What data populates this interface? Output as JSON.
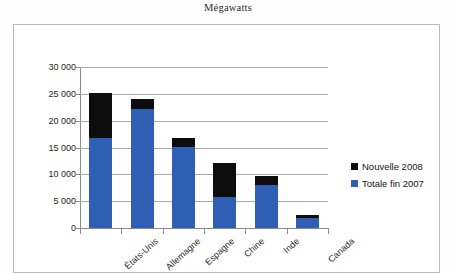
{
  "chart_data": {
    "type": "bar",
    "subtype": "stacked-vertical",
    "title": "Mégawatts",
    "xlabel": "",
    "ylabel": "",
    "ylim": [
      0,
      30000
    ],
    "ytick_step": 5000,
    "ytick_labels": [
      "30 000",
      "25 000",
      "20 000",
      "15 000",
      "10 000",
      "5 000",
      "0"
    ],
    "ytick_values": [
      30000,
      25000,
      20000,
      15000,
      10000,
      5000,
      0
    ],
    "grid": true,
    "grid_axis": "y",
    "legend_position": "right",
    "categories": [
      "États-Unis",
      "Allemagne",
      "Espagne",
      "Chine",
      "Inde",
      "Canada"
    ],
    "series": [
      {
        "name": "Totale fin 2007",
        "color": "#2f5fb4",
        "values": [
          16800,
          22200,
          15100,
          5800,
          8000,
          1800
        ]
      },
      {
        "name": "Nouvelle 2008",
        "color": "#0d0d0d",
        "values": [
          8400,
          1900,
          1700,
          6400,
          1700,
          600
        ]
      }
    ],
    "totals": [
      25200,
      24100,
      16800,
      12200,
      9700,
      2400
    ],
    "units": "Mégawatts"
  },
  "legend": {
    "items": [
      {
        "label": "Nouvelle 2008",
        "color": "#0d0d0d"
      },
      {
        "label": "Totale fin 2007",
        "color": "#2f5fb4"
      }
    ]
  }
}
